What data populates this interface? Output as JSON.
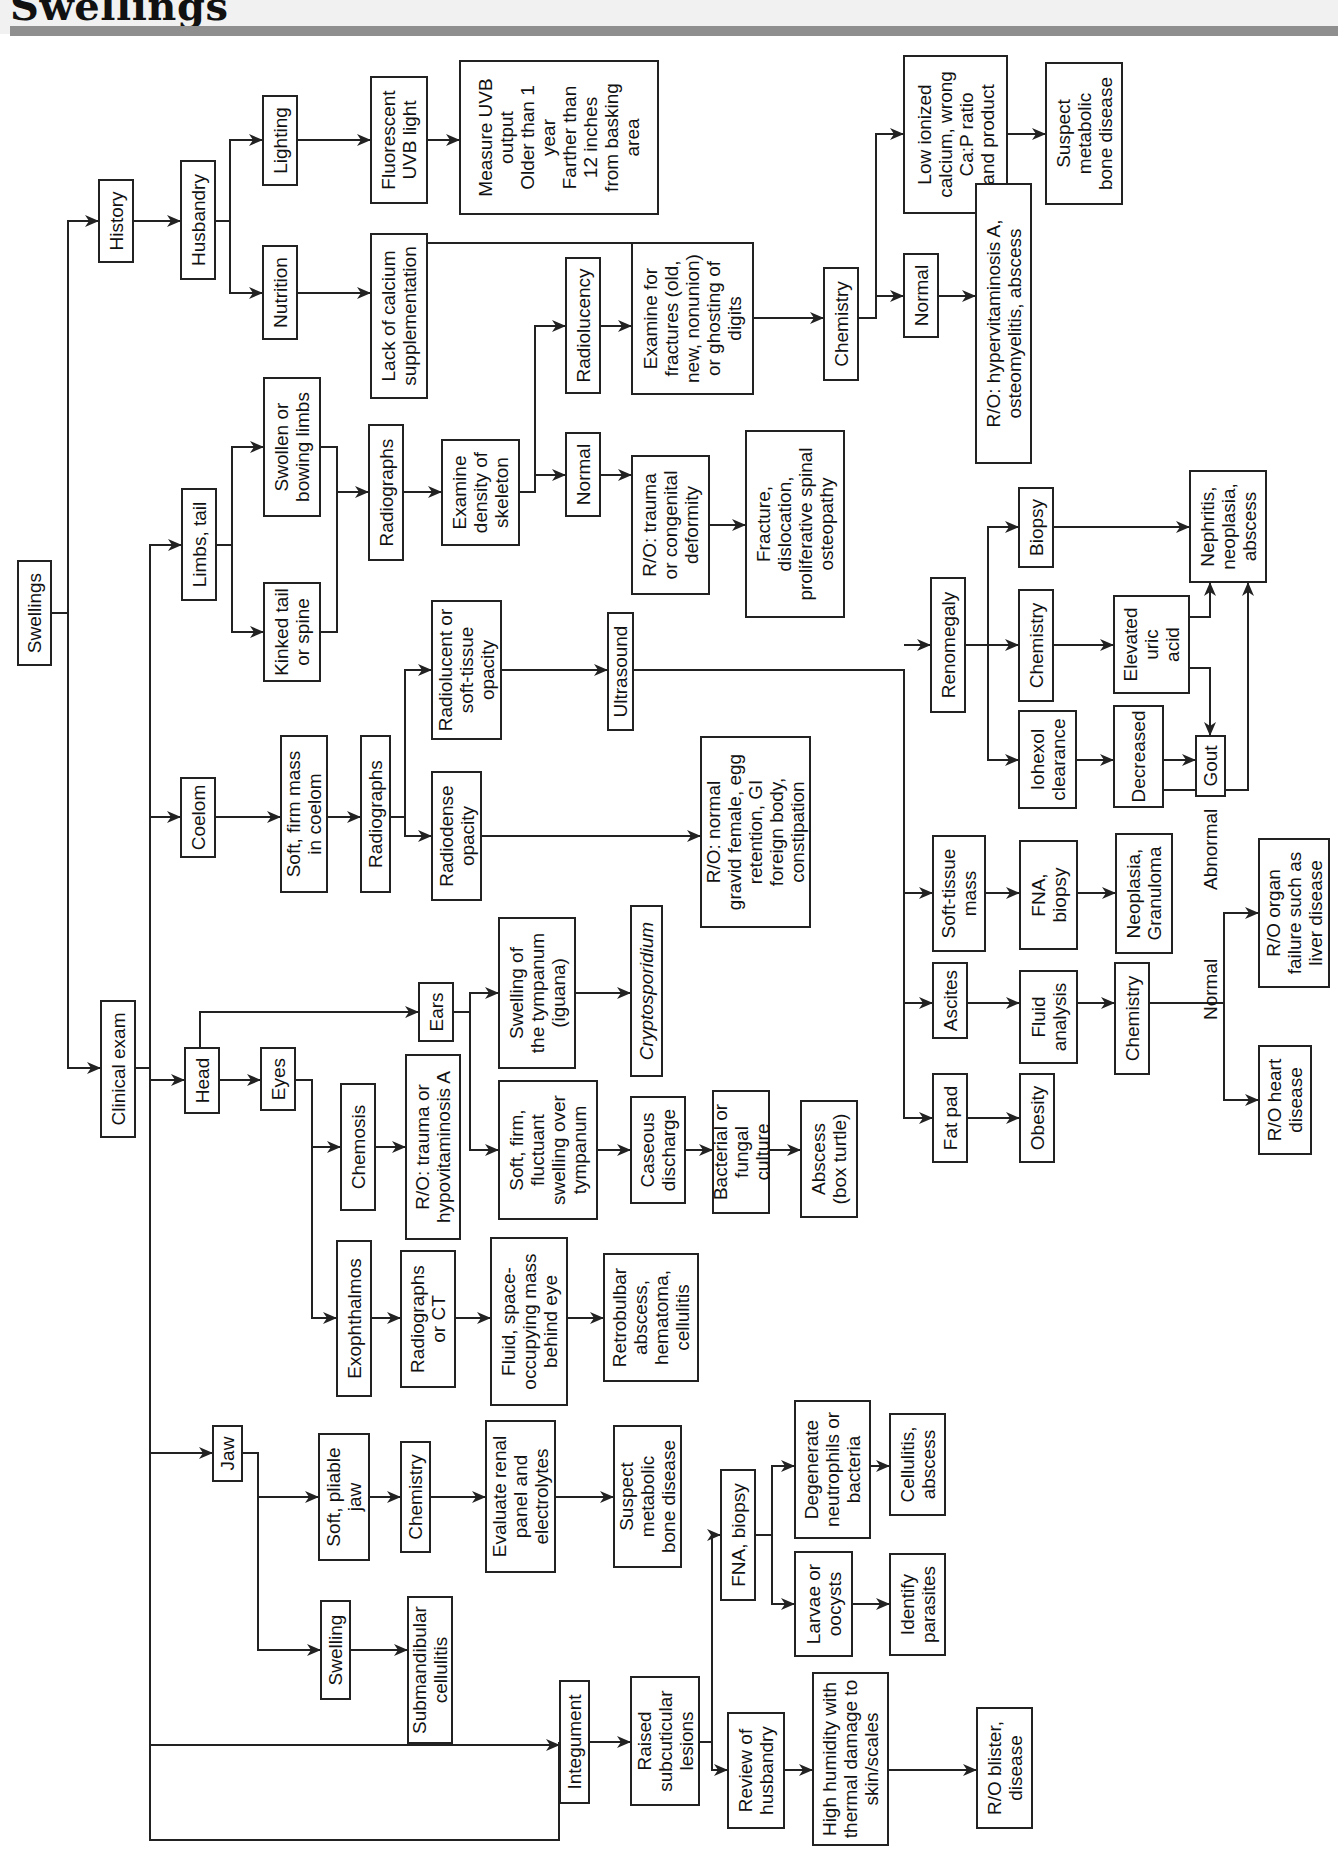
{
  "header": {
    "title": "Swellings"
  },
  "diagram": {
    "type": "clinical-decision-flowchart",
    "orientation": "rotated-90-ccw",
    "colors": {
      "stroke": "#222222",
      "box_fill": "#ffffff",
      "title_rule": "#8f8f8f",
      "title_bg": "#f1f1f1"
    },
    "nodes": [
      {
        "id": "swellings",
        "label": "Swellings",
        "x": 1379,
        "y": 17,
        "w": 106,
        "h": 36
      },
      {
        "id": "history",
        "label": "History",
        "x": 1597,
        "y": 98,
        "w": 82,
        "h": 36
      },
      {
        "id": "clinical_exam",
        "label": "Clinical exam",
        "x": 720,
        "y": 100,
        "w": 138,
        "h": 36
      },
      {
        "id": "husbandry",
        "label": "Husbandry",
        "x": 1578,
        "y": 180,
        "w": 120,
        "h": 36
      },
      {
        "id": "lighting",
        "label": "Lighting",
        "x": 1671,
        "y": 262,
        "w": 91,
        "h": 36
      },
      {
        "id": "nutrition",
        "label": "Nutrition",
        "x": 1519,
        "y": 262,
        "w": 95,
        "h": 36
      },
      {
        "id": "fluorescent_uvb",
        "label": "Fluorescent\nUVB light",
        "x": 1654,
        "y": 370,
        "w": 128,
        "h": 58
      },
      {
        "id": "lack_calcium",
        "label": "Lack of calcium\nsupplementation",
        "x": 1465,
        "y": 370,
        "w": 166,
        "h": 58
      },
      {
        "id": "uvb_checks",
        "label": "Measure UVB\noutput\nOlder than 1\nyear\nFarther than\n12 inches\nfrom basking\narea",
        "x": 1683,
        "y": 463,
        "w": 155,
        "h": 201
      },
      {
        "id": "limbs_tail",
        "label": "Limbs, tail",
        "x": 1257,
        "y": 181,
        "w": 113,
        "h": 36
      },
      {
        "id": "swollen_bowing",
        "label": "Swollen or\nbowing limbs",
        "x": 1301,
        "y": 263,
        "w": 140,
        "h": 58
      },
      {
        "id": "kinked_tail",
        "label": "Kinked tail\nor spine",
        "x": 1176,
        "y": 263,
        "w": 100,
        "h": 58
      },
      {
        "id": "radiographs_limbs",
        "label": "Radiographs",
        "x": 1216,
        "y": 368,
        "w": 137,
        "h": 36
      },
      {
        "id": "examine_density",
        "label": "Examine\ndensity of\nskeleton",
        "x": 1203,
        "y": 440,
        "w": 107,
        "h": 79
      },
      {
        "id": "radiolucency",
        "label": "Radiolucency",
        "x": 1360,
        "y": 565,
        "w": 137,
        "h": 36
      },
      {
        "id": "normal_skeleton",
        "label": "Normal",
        "x": 1191,
        "y": 565,
        "w": 85,
        "h": 36
      },
      {
        "id": "examine_fractures",
        "label": "Examine for\nfractures (old,\nnew, nonunion)\nor ghosting of\ndigits",
        "x": 1377,
        "y": 634,
        "w": 153,
        "h": 123
      },
      {
        "id": "ro_trauma_congenital",
        "label": "R/O: trauma\nor congenital\ndeformity",
        "x": 1195,
        "y": 634,
        "w": 140,
        "h": 79
      },
      {
        "id": "fracture_dislocation",
        "label": "Fracture,\ndislocation,\nproliferative spinal\nosteopathy",
        "x": 1146,
        "y": 745,
        "w": 188,
        "h": 100
      },
      {
        "id": "chemistry_bone",
        "label": "Chemistry",
        "x": 1485,
        "y": 823,
        "w": 114,
        "h": 36
      },
      {
        "id": "low_ionized_calcium",
        "label": "Low ionized\ncalcium, wrong\nCa:P ratio\nand product",
        "x": 1684,
        "y": 903,
        "w": 159,
        "h": 105
      },
      {
        "id": "normal_chemistry",
        "label": "Normal",
        "x": 1534,
        "y": 903,
        "w": 85,
        "h": 36
      },
      {
        "id": "suspect_mbd_top",
        "label": "Suspect\nmetabolic\nbone disease",
        "x": 1692,
        "y": 1045,
        "w": 143,
        "h": 78
      },
      {
        "id": "ro_hypervitaminosis",
        "label": "R/O: hypervitaminosis A,\nosteomyelitis, abscess",
        "x": 1336,
        "y": 975,
        "w": 281,
        "h": 57
      },
      {
        "id": "coelom",
        "label": "Coelom",
        "x": 998,
        "y": 180,
        "w": 81,
        "h": 36
      },
      {
        "id": "soft_firm_mass",
        "label": "Soft, firm mass\nin coelom",
        "x": 965,
        "y": 280,
        "w": 158,
        "h": 48
      },
      {
        "id": "radiographs_coelom",
        "label": "Radiographs",
        "x": 965,
        "y": 360,
        "w": 158,
        "h": 31
      },
      {
        "id": "radiolucent_soft_tissue",
        "label": "Radiolucent or\nsoft-tissue\nopacity",
        "x": 1111,
        "y": 431,
        "w": 140,
        "h": 71
      },
      {
        "id": "radiodense_opacity",
        "label": "Radiodense\nopacity",
        "x": 985,
        "y": 431,
        "w": 130,
        "h": 51
      },
      {
        "id": "ultrasound",
        "label": "Ultrasound",
        "x": 1143,
        "y": 607,
        "w": 119,
        "h": 27
      },
      {
        "id": "ro_normal_gravid",
        "label": "R/O: normal\ngravid female, egg\nretention, GI\nforeign body,\nconstipation",
        "x": 930,
        "y": 700,
        "w": 192,
        "h": 111
      },
      {
        "id": "renomegaly",
        "label": "Renomegaly",
        "x": 1001,
        "y": 930,
        "w": 136,
        "h": 36
      },
      {
        "id": "biopsy_kidney",
        "label": "Biopsy",
        "x": 1188,
        "y": 1018,
        "w": 81,
        "h": 36
      },
      {
        "id": "chemistry_kidney",
        "label": "Chemistry",
        "x": 996,
        "y": 1018,
        "w": 113,
        "h": 36
      },
      {
        "id": "iohexol_clearance",
        "label": "Iohexol\nclearance",
        "x": 917,
        "y": 1018,
        "w": 99,
        "h": 59
      },
      {
        "id": "elevated_uric_acid",
        "label": "Elevated\nuric\nacid",
        "x": 1006,
        "y": 1113,
        "w": 99,
        "h": 77
      },
      {
        "id": "decreased",
        "label": "Decreased",
        "x": 957,
        "y": 1113,
        "w": 55,
        "h": 31
      },
      {
        "id": "gout",
        "label": "Gout",
        "x": 909,
        "y": 1195,
        "w": 62,
        "h": 31
      },
      {
        "id": "nephritis_neoplasia",
        "label": "Nephritis,\nneoplasia,\nabscess",
        "x": 1135,
        "y": 1189,
        "w": 113,
        "h": 78
      },
      {
        "id": "soft_tissue_mass",
        "label": "Soft-tissue\nmass",
        "x": 1005,
        "y": 1252,
        "w": 117,
        "h": 54
      },
      {
        "id": "fna_biopsy_coelom",
        "label": "FNA,\nbiopsy",
        "x": 1002,
        "y": 1339,
        "w": 110,
        "h": 59
      },
      {
        "id": "neoplasia_granuloma",
        "label": "Neoplasia,\nGranuloma",
        "x": 1008,
        "y": 1114,
        "w": 121,
        "h": 58
      },
      {
        "id": "ascites",
        "label": "Ascites",
        "x": 1000,
        "y": 1000,
        "w": 77,
        "h": 36
      },
      {
        "id": "fluid_analysis",
        "label": "Fluid\nanalysis",
        "x": 1000,
        "y": 1000,
        "w": 94,
        "h": 59
      },
      {
        "id": "chemistry_ascites",
        "label": "Chemistry",
        "x": 1000,
        "y": 1000,
        "w": 113,
        "h": 36
      },
      {
        "id": "fat_pad",
        "label": "Fat pad",
        "x": 1000,
        "y": 1000,
        "w": 90,
        "h": 36
      },
      {
        "id": "obesity",
        "label": "Obesity",
        "x": 1000,
        "y": 1000,
        "w": 90,
        "h": 36
      },
      {
        "id": "ro_organ_failure",
        "label": "R/O organ\nfailure such as\nliver disease",
        "x": 1000,
        "y": 1000,
        "w": 150,
        "h": 72
      },
      {
        "id": "ro_heart_disease",
        "label": "R/O heart\ndisease",
        "x": 1000,
        "y": 1000,
        "w": 110,
        "h": 54
      },
      {
        "id": "head",
        "label": "Head",
        "x": 1000,
        "y": 1000,
        "w": 67,
        "h": 36
      },
      {
        "id": "eyes",
        "label": "Eyes",
        "x": 1000,
        "y": 1000,
        "w": 64,
        "h": 36
      },
      {
        "id": "ears",
        "label": "Ears",
        "x": 1000,
        "y": 1000,
        "w": 60,
        "h": 36
      },
      {
        "id": "chemosis",
        "label": "Chemosis",
        "x": 1000,
        "y": 1000,
        "w": 128,
        "h": 36
      },
      {
        "id": "exophthalmos",
        "label": "Exophthalmos",
        "x": 1000,
        "y": 1000,
        "w": 157,
        "h": 36
      },
      {
        "id": "ro_trauma_hypovit",
        "label": "R/O: trauma or\nhypovitaminosis A",
        "x": 1000,
        "y": 1000,
        "w": 186,
        "h": 56
      },
      {
        "id": "radiographs_ct",
        "label": "Radiographs\nor CT",
        "x": 1000,
        "y": 1000,
        "w": 138,
        "h": 56
      },
      {
        "id": "fluid_mass_eye",
        "label": "Fluid, space-\noccupying mass\nbehind eye",
        "x": 1000,
        "y": 1000,
        "w": 169,
        "h": 78
      },
      {
        "id": "retrobulbar",
        "label": "Retrobulbar\nabscess,\nhematoma,\ncellulitis",
        "x": 1000,
        "y": 1000,
        "w": 129,
        "h": 96
      },
      {
        "id": "swelling_tympanum",
        "label": "Swelling of\nthe tympanum\n(iguana)",
        "x": 1000,
        "y": 1000,
        "w": 152,
        "h": 78
      },
      {
        "id": "cryptosporidium",
        "label": "Cryptosporidium",
        "x": 1000,
        "y": 1000,
        "w": 172,
        "h": 33,
        "italic": true
      },
      {
        "id": "soft_firm_fluctuant",
        "label": "Soft, firm,\nfluctuant\nswelling over\ntympanum",
        "x": 1000,
        "y": 1000,
        "w": 140,
        "h": 100
      },
      {
        "id": "caseous_discharge",
        "label": "Caseous\ndischarge",
        "x": 1000,
        "y": 1000,
        "w": 108,
        "h": 56
      },
      {
        "id": "bacterial_fungal",
        "label": "Bacterial or\nfungal culture",
        "x": 1000,
        "y": 1000,
        "w": 124,
        "h": 58
      },
      {
        "id": "abscess_box_turtle",
        "label": "Abscess\n(box turtle)",
        "x": 1000,
        "y": 1000,
        "w": 118,
        "h": 58
      },
      {
        "id": "jaw",
        "label": "Jaw",
        "x": 1000,
        "y": 1000,
        "w": 57,
        "h": 31
      },
      {
        "id": "soft_pliable_jaw",
        "label": "Soft, pliable\njaw",
        "x": 1000,
        "y": 1000,
        "w": 128,
        "h": 52
      },
      {
        "id": "swelling_jaw",
        "label": "Swelling",
        "x": 1000,
        "y": 1000,
        "w": 100,
        "h": 31
      },
      {
        "id": "chemistry_jaw",
        "label": "Chemistry",
        "x": 1000,
        "y": 1000,
        "w": 112,
        "h": 31
      },
      {
        "id": "submandibular_cellulitis",
        "label": "Submandibular\ncellulitis",
        "x": 1000,
        "y": 1000,
        "w": 148,
        "h": 46
      },
      {
        "id": "evaluate_renal",
        "label": "Evaluate renal\npanel and\nelectrolytes",
        "x": 1000,
        "y": 1000,
        "w": 153,
        "h": 71
      },
      {
        "id": "suspect_mbd_jaw",
        "label": "Suspect\nmetabolic\nbone disease",
        "x": 1000,
        "y": 1000,
        "w": 143,
        "h": 69
      },
      {
        "id": "integument",
        "label": "Integument",
        "x": 1000,
        "y": 1000,
        "w": 124,
        "h": 31
      },
      {
        "id": "raised_subcuticular",
        "label": "Raised\nsubcuticular\nlesions",
        "x": 1000,
        "y": 1000,
        "w": 130,
        "h": 70
      },
      {
        "id": "fna_biopsy_skin",
        "label": "FNA, biopsy",
        "x": 1000,
        "y": 1000,
        "w": 132,
        "h": 36
      },
      {
        "id": "degenerate_neutrophils",
        "label": "Degenerate\nneutrophils or\nbacteria",
        "x": 1000,
        "y": 1000,
        "w": 139,
        "h": 77
      },
      {
        "id": "larvae_oocysts",
        "label": "Larvae or\noocysts",
        "x": 1000,
        "y": 1000,
        "w": 106,
        "h": 59
      },
      {
        "id": "cellulitis_abscess",
        "label": "Cellulitis,\nabscess",
        "x": 1000,
        "y": 1000,
        "w": 103,
        "h": 57
      },
      {
        "id": "identify_parasites",
        "label": "Identify\nparasites",
        "x": 1000,
        "y": 1000,
        "w": 103,
        "h": 57
      },
      {
        "id": "review_husbandry",
        "label": "Review of\nhusbandry",
        "x": 1000,
        "y": 1000,
        "w": 117,
        "h": 58
      },
      {
        "id": "high_humidity",
        "label": "High humidity with\nthermal damage to\nskin/scales",
        "x": 1000,
        "y": 1000,
        "w": 174,
        "h": 77
      },
      {
        "id": "ro_blister",
        "label": "R/O blister,\ndisease",
        "x": 1000,
        "y": 1000,
        "w": 122,
        "h": 57
      }
    ],
    "edge_labels": [
      {
        "id": "lbl_normal",
        "label": "Normal"
      },
      {
        "id": "lbl_abnormal",
        "label": "Abnormal"
      }
    ]
  }
}
